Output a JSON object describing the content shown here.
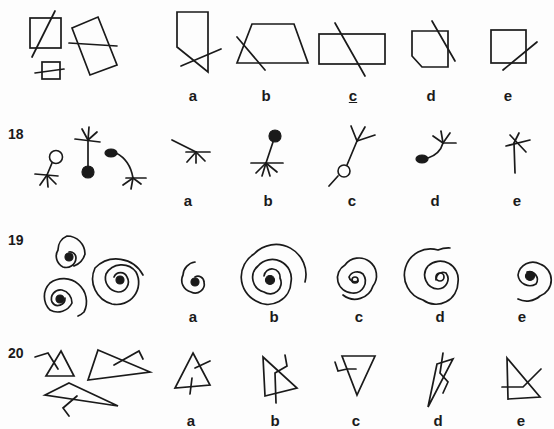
{
  "rows": [
    {
      "number": "",
      "item": "17",
      "options": [
        {
          "label": "a",
          "underlined": false
        },
        {
          "label": "b",
          "underlined": false
        },
        {
          "label": "c",
          "underlined": true
        },
        {
          "label": "d",
          "underlined": false
        },
        {
          "label": "e",
          "underlined": false
        }
      ],
      "reference_figures": [
        "square-with-line",
        "small-square-with-line",
        "tilted-rectangle-with-line"
      ]
    },
    {
      "number": "18",
      "options": [
        {
          "label": "a",
          "underlined": false
        },
        {
          "label": "b",
          "underlined": false
        },
        {
          "label": "c",
          "underlined": false
        },
        {
          "label": "d",
          "underlined": false
        },
        {
          "label": "e",
          "underlined": false
        }
      ],
      "reference_figures": [
        "open-circle-stem-star",
        "star-stem-filled-circle",
        "filled-oval-curve-star"
      ]
    },
    {
      "number": "19",
      "options": [
        {
          "label": "a",
          "underlined": false
        },
        {
          "label": "b",
          "underlined": false
        },
        {
          "label": "c",
          "underlined": false
        },
        {
          "label": "d",
          "underlined": false
        },
        {
          "label": "e",
          "underlined": false
        }
      ],
      "reference_figures": [
        "small-spiral-dot",
        "medium-spiral-dot",
        "large-spiral-dot"
      ]
    },
    {
      "number": "20",
      "options": [
        {
          "label": "a",
          "underlined": false
        },
        {
          "label": "b",
          "underlined": false
        },
        {
          "label": "c",
          "underlined": false
        },
        {
          "label": "d",
          "underlined": false
        },
        {
          "label": "e",
          "underlined": false
        }
      ],
      "reference_figures": [
        "triangle-with-hook",
        "wide-triangle-with-hook",
        "long-triangle-with-hook"
      ]
    }
  ]
}
